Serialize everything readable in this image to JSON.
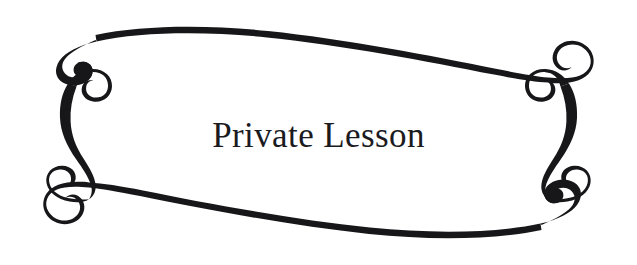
{
  "canvas": {
    "width": 637,
    "height": 265,
    "background_color": "#ffffff"
  },
  "ornament": {
    "name": "calligraphic-swash-frame",
    "ink_color": "#17171a",
    "description": "Decorative flourish border with four tapered swashes terminating in spiral curls at each corner",
    "parts": [
      "top-sweep",
      "bottom-sweep",
      "left-swash",
      "right-swash"
    ]
  },
  "title": {
    "text": "Private Lesson",
    "color": "#1b1b1f",
    "font_size_px": 35
  }
}
